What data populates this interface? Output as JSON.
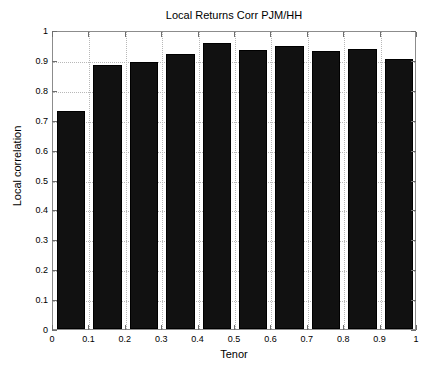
{
  "chart_data": {
    "type": "bar",
    "title": "Local Returns Corr PJM/HH",
    "xlabel": "Tenor",
    "ylabel": "Local correlation",
    "categories": [
      "0.05",
      "0.15",
      "0.25",
      "0.35",
      "0.45",
      "0.55",
      "0.65",
      "0.75",
      "0.85",
      "0.95"
    ],
    "bar_left_edges": [
      0.0,
      0.1,
      0.2,
      0.3,
      0.4,
      0.5,
      0.6,
      0.7,
      0.8,
      0.9
    ],
    "bar_right_edges": [
      0.1,
      0.2,
      0.3,
      0.4,
      0.5,
      0.6,
      0.7,
      0.8,
      0.9,
      1.0
    ],
    "values": [
      0.73,
      0.882,
      0.894,
      0.921,
      0.955,
      0.932,
      0.948,
      0.929,
      0.935,
      0.903
    ],
    "xlim": [
      0,
      1
    ],
    "ylim": [
      0,
      1
    ],
    "xticks": [
      0,
      0.1,
      0.2,
      0.3,
      0.4,
      0.5,
      0.6,
      0.7,
      0.8,
      0.9,
      1
    ],
    "yticks": [
      0,
      0.1,
      0.2,
      0.3,
      0.4,
      0.5,
      0.6,
      0.7,
      0.8,
      0.9,
      1
    ],
    "xtick_labels": [
      "0",
      "0.1",
      "0.2",
      "0.3",
      "0.4",
      "0.5",
      "0.6",
      "0.7",
      "0.8",
      "0.9",
      "1"
    ],
    "ytick_labels": [
      "0",
      "0.1",
      "0.2",
      "0.3",
      "0.4",
      "0.5",
      "0.6",
      "0.7",
      "0.8",
      "0.9",
      "1"
    ],
    "grid": true,
    "legend": null,
    "bar_color": "#111111",
    "bar_edge_color": "#000000",
    "grid_color": "#b8b8b8",
    "axis_color": "#8c8c8c",
    "background_color": "#ffffff"
  }
}
